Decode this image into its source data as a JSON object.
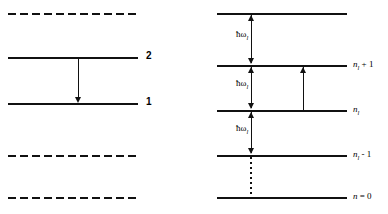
{
  "figure": {
    "line_color": "#111111",
    "background": "#ffffff"
  },
  "left_panel": {
    "name": "two-level-system",
    "levels": [
      {
        "id": "dashed-top",
        "style": "dashed",
        "label": "",
        "y": 13
      },
      {
        "id": "level-2",
        "style": "solid",
        "label": "2",
        "y": 57
      },
      {
        "id": "level-1",
        "style": "solid",
        "label": "1",
        "y": 103
      },
      {
        "id": "dashed-lower",
        "style": "dashed",
        "label": "",
        "y": 155
      },
      {
        "id": "dashed-bottom",
        "style": "dashed",
        "label": "",
        "y": 197
      }
    ],
    "transition": {
      "direction": "down",
      "from_label": "2",
      "to_label": "1"
    }
  },
  "right_panel": {
    "name": "photon-number-ladder",
    "levels": [
      {
        "id": "n-l-plus-2",
        "style": "solid",
        "label": "",
        "y": 13
      },
      {
        "id": "n-l-plus-1",
        "style": "solid",
        "label": "n_l + 1",
        "y": 65
      },
      {
        "id": "n-l",
        "style": "solid",
        "label": "n_l",
        "y": 110
      },
      {
        "id": "n-l-minus-1",
        "style": "solid",
        "label": "n_l - 1",
        "y": 155
      },
      {
        "id": "n-zero",
        "style": "solid",
        "label": "n = 0",
        "y": 197
      }
    ],
    "labels": {
      "n_sym": "n",
      "sub_l": "l",
      "plus_one": "+ 1",
      "minus_one": "- 1",
      "equals_zero": "= 0"
    },
    "energy_quanta": [
      {
        "id": "quantum-top",
        "text": "ħω",
        "sub": "l",
        "y": 34
      },
      {
        "id": "quantum-middle",
        "text": "ħω",
        "sub": "l",
        "y": 83
      },
      {
        "id": "quantum-lower",
        "text": "ħω",
        "sub": "l",
        "y": 128
      }
    ],
    "absorption_arrow": {
      "direction": "up",
      "from_label": "n_l",
      "to_label": "n_l + 1"
    },
    "dotted_connector": {
      "from_label": "n_l - 1",
      "to_label": "n = 0"
    }
  }
}
